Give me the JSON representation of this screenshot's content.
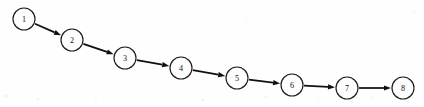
{
  "figure": {
    "width": 424,
    "height": 107,
    "background_color": "#fefefe",
    "stroke_color": "#101010",
    "node_fill_color": "#fdfdfd",
    "node_radius": 11
  },
  "graph_data": {
    "type": "diagram",
    "layout": "linear-chain",
    "directed": true,
    "node_count": 8,
    "edge_count": 7,
    "nodes": [
      {
        "id": "1",
        "label": "1",
        "cx": 24,
        "cy": 19
      },
      {
        "id": "2",
        "label": "2",
        "cx": 72,
        "cy": 40
      },
      {
        "id": "3",
        "label": "3",
        "cx": 125,
        "cy": 58
      },
      {
        "id": "4",
        "label": "4",
        "cx": 181,
        "cy": 68
      },
      {
        "id": "5",
        "label": "5",
        "cx": 237,
        "cy": 78
      },
      {
        "id": "6",
        "label": "6",
        "cx": 292,
        "cy": 85
      },
      {
        "id": "7",
        "label": "7",
        "cx": 347,
        "cy": 88
      },
      {
        "id": "8",
        "label": "8",
        "cx": 403,
        "cy": 88
      }
    ],
    "edges": [
      {
        "from": "1",
        "to": "2"
      },
      {
        "from": "2",
        "to": "3"
      },
      {
        "from": "3",
        "to": "4"
      },
      {
        "from": "4",
        "to": "5"
      },
      {
        "from": "5",
        "to": "6"
      },
      {
        "from": "6",
        "to": "7"
      },
      {
        "from": "7",
        "to": "8"
      }
    ]
  }
}
